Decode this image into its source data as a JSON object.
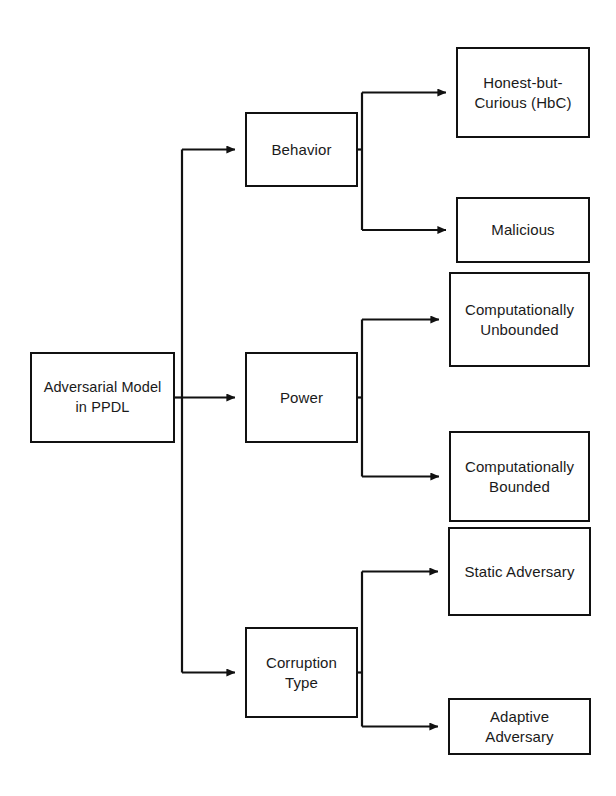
{
  "diagram": {
    "type": "horizontal-tree",
    "background_color": "#ffffff",
    "line_color": "#111111",
    "text_color": "#1a1a1a",
    "root": {
      "id": "root",
      "label": "Adversarial Model\nin PPDL",
      "box": {
        "x": 30,
        "y": 352,
        "width": 145,
        "height": 91
      }
    },
    "categories": [
      {
        "id": "behavior",
        "label": "Behavior",
        "box": {
          "x": 245,
          "y": 112,
          "width": 113,
          "height": 75
        },
        "children": [
          {
            "id": "honest-but-curious",
            "label": "Honest-but-\nCurious (HbC)",
            "box": {
              "x": 456,
              "y": 47,
              "width": 134,
              "height": 91
            }
          },
          {
            "id": "malicious",
            "label": "Malicious",
            "box": {
              "x": 456,
              "y": 197,
              "width": 134,
              "height": 66
            }
          }
        ]
      },
      {
        "id": "power",
        "label": "Power",
        "box": {
          "x": 245,
          "y": 352,
          "width": 113,
          "height": 91
        },
        "children": [
          {
            "id": "computationally-unbounded",
            "label": "Computationally\nUnbounded",
            "box": {
              "x": 449,
              "y": 272,
              "width": 141,
              "height": 95
            }
          },
          {
            "id": "computationally-bounded",
            "label": "Computationally\nBounded",
            "box": {
              "x": 449,
              "y": 431,
              "width": 141,
              "height": 91
            }
          }
        ]
      },
      {
        "id": "corruption-type",
        "label": "Corruption\nType",
        "box": {
          "x": 245,
          "y": 627,
          "width": 113,
          "height": 91
        },
        "children": [
          {
            "id": "static-adversary",
            "label": "Static Adversary",
            "box": {
              "x": 448,
              "y": 527,
              "width": 143,
              "height": 89
            }
          },
          {
            "id": "adaptive-adversary",
            "label": "Adaptive Adversary",
            "box": {
              "x": 448,
              "y": 698,
              "width": 143,
              "height": 57
            }
          }
        ]
      }
    ],
    "connectors": {
      "root_stub_x": 182,
      "branch_x": 362,
      "arrow_size": 9,
      "stroke_width": 2.2
    }
  }
}
